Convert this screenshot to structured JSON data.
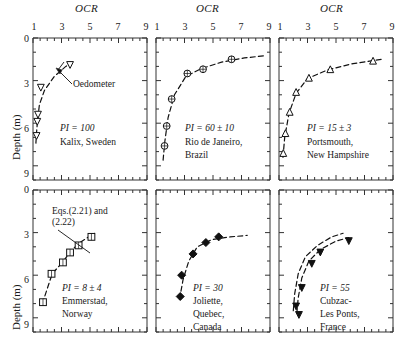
{
  "figure": {
    "xaxis_title": "OCR",
    "yaxis_title": "Depth (m)",
    "x_ticklabels": [
      "1",
      "3",
      "5",
      "7",
      "9"
    ],
    "y_ticklabels": [
      "0",
      "3",
      "6",
      "9"
    ],
    "xlim": [
      1,
      9
    ],
    "ylim": [
      0,
      10
    ],
    "annotation_equations": {
      "line1": "Eqs.(2.21) and",
      "line2": "(2.22)"
    },
    "annotation_oedometer": "Oedometer"
  },
  "chart_data": [
    {
      "type": "scatter",
      "panel": "top-left",
      "title": "",
      "xlabel": "OCR",
      "ylabel": "Depth (m)",
      "xlim": [
        1,
        9
      ],
      "ylim": [
        0,
        10
      ],
      "grid": false,
      "marker": "open-inverted-triangle",
      "pi_label": "PI = 100",
      "site_lines": [
        "Kalix, Sweden"
      ],
      "annotations": [
        "Oedometer"
      ],
      "x": [
        3.6,
        1.55,
        1.35,
        1.3,
        1.25
      ],
      "y": [
        1.9,
        3.5,
        5.4,
        5.9,
        6.9
      ],
      "curve_x": [
        1.2,
        1.25,
        1.32,
        1.45,
        1.8,
        2.5,
        3.3,
        3.7
      ],
      "curve_y": [
        7.4,
        6.6,
        5.8,
        4.7,
        3.7,
        2.7,
        2.0,
        1.75
      ]
    },
    {
      "type": "scatter",
      "panel": "top-middle",
      "title": "",
      "xlabel": "OCR",
      "ylabel": "Depth (m)",
      "xlim": [
        1,
        9
      ],
      "ylim": [
        0,
        10
      ],
      "grid": false,
      "marker": "circle-cross",
      "pi_label": "PI = 60 ± 10",
      "site_lines": [
        "Rio de Janeiro,",
        "Brazil"
      ],
      "annotations": [],
      "x": [
        6.3,
        4.3,
        3.2,
        2.1,
        1.75,
        1.6
      ],
      "y": [
        1.5,
        2.2,
        2.5,
        4.3,
        6.2,
        7.6
      ],
      "curve_x": [
        1.5,
        1.62,
        1.85,
        2.3,
        3.1,
        4.2,
        5.6,
        7.2,
        8.6
      ],
      "curve_y": [
        8.6,
        7.3,
        5.6,
        4.0,
        2.7,
        2.15,
        1.7,
        1.4,
        1.25
      ]
    },
    {
      "type": "scatter",
      "panel": "top-right",
      "title": "",
      "xlabel": "OCR",
      "ylabel": "Depth (m)",
      "xlim": [
        1,
        9
      ],
      "ylim": [
        0,
        10
      ],
      "grid": false,
      "marker": "open-triangle",
      "pi_label": "PI = 15 ± 3",
      "site_lines": [
        "Portsmouth,",
        "New Hampshire"
      ],
      "annotations": [],
      "x": [
        7.6,
        4.6,
        3.1,
        2.2,
        1.75,
        1.45,
        1.3
      ],
      "y": [
        1.6,
        2.2,
        2.8,
        3.8,
        5.2,
        6.7,
        8.1
      ],
      "curve_x": [
        1.28,
        1.4,
        1.7,
        2.2,
        3.0,
        4.4,
        6.2,
        8.2
      ],
      "curve_y": [
        8.4,
        7.0,
        5.3,
        3.9,
        2.85,
        2.25,
        1.8,
        1.5
      ]
    },
    {
      "type": "scatter",
      "panel": "bottom-left",
      "title": "",
      "xlabel": "OCR",
      "ylabel": "Depth (m)",
      "xlim": [
        1,
        9
      ],
      "ylim": [
        0,
        10
      ],
      "grid": false,
      "marker": "open-square",
      "pi_label": "PI = 8 ± 4",
      "site_lines": [
        "Emmerstad,",
        "Norway"
      ],
      "annotations": [
        "Eqs.(2.21) and (2.22)"
      ],
      "x": [
        5.1,
        4.2,
        3.6,
        3.1,
        2.3,
        1.7
      ],
      "y": [
        3.3,
        3.9,
        4.4,
        5.1,
        5.9,
        7.9
      ],
      "curve_x": [
        1.65,
        2.35,
        3.15,
        3.65,
        4.3,
        5.3
      ],
      "curve_y": [
        8.0,
        5.9,
        5.0,
        4.3,
        3.7,
        3.05
      ]
    },
    {
      "type": "scatter",
      "panel": "bottom-middle",
      "title": "",
      "xlabel": "OCR",
      "ylabel": "Depth (m)",
      "xlim": [
        1,
        9
      ],
      "ylim": [
        0,
        10
      ],
      "grid": false,
      "marker": "filled-diamond",
      "pi_label": "PI = 30",
      "site_lines": [
        "Joliette,",
        "Quebec,",
        "Canada"
      ],
      "annotations": [],
      "x": [
        5.4,
        4.5,
        3.6,
        2.8,
        2.7
      ],
      "y": [
        3.3,
        3.7,
        4.5,
        6.0,
        7.5
      ],
      "curve_x": [
        2.65,
        2.9,
        3.3,
        3.9,
        4.9,
        6.2,
        7.4
      ],
      "curve_y": [
        7.7,
        6.3,
        5.0,
        4.0,
        3.5,
        3.3,
        3.2
      ]
    },
    {
      "type": "scatter",
      "panel": "bottom-right",
      "title": "",
      "xlabel": "OCR",
      "ylabel": "Depth (m)",
      "xlim": [
        1,
        9
      ],
      "ylim": [
        0,
        10
      ],
      "grid": false,
      "marker": "filled-inverted-triangle",
      "pi_label": "PI = 55",
      "site_lines": [
        "Cubzac-",
        "Les Ponts,",
        "France"
      ],
      "annotations": [],
      "x": [
        5.9,
        3.9,
        3.3,
        2.6,
        2.2,
        2.4
      ],
      "y": [
        3.6,
        4.4,
        5.2,
        6.9,
        8.2,
        8.8
      ],
      "curve_x": [
        2.25,
        2.35,
        2.6,
        3.1,
        3.9,
        5.0,
        5.9
      ],
      "curve_y": [
        8.7,
        7.6,
        6.2,
        5.0,
        4.2,
        3.6,
        3.35
      ],
      "curve2_x": [
        2.0,
        2.1,
        2.35,
        2.85,
        3.7,
        4.7,
        5.5
      ],
      "curve2_y": [
        8.5,
        7.3,
        5.9,
        4.7,
        3.9,
        3.3,
        3.05
      ]
    }
  ]
}
